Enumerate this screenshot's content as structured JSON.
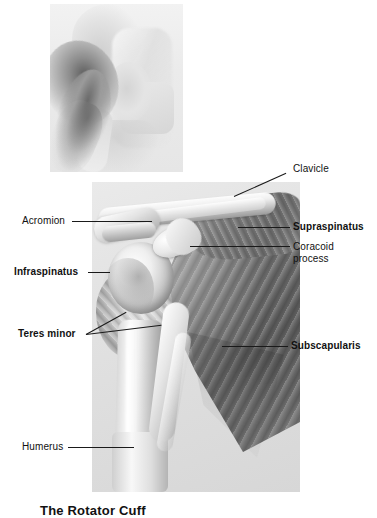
{
  "figure": {
    "caption": "The Rotator Cuff",
    "style": "grayscale medical illustration",
    "panel_background": "#e2e2e2",
    "page_background": "#ffffff",
    "text_color": "#111111",
    "leader_line_color": "#1a1a1a"
  },
  "panels": {
    "inset": {
      "name": "inset-sketch",
      "description": "shoulder sketch"
    },
    "main": {
      "name": "main-illustration",
      "description": "anterior scapula and humerus with rotator cuff muscles"
    }
  },
  "labels": [
    {
      "id": "clavicle",
      "text": "Clavicle",
      "bold": false,
      "lines": [
        "Clavicle"
      ]
    },
    {
      "id": "acromion",
      "text": "Acromion",
      "bold": false,
      "lines": [
        "Acromion"
      ]
    },
    {
      "id": "supraspinatus",
      "text": "Supraspinatus",
      "bold": true,
      "lines": [
        "Supraspinatus"
      ]
    },
    {
      "id": "coracoid",
      "text": "Coracoid process",
      "bold": false,
      "lines": [
        "Coracoid",
        "process"
      ]
    },
    {
      "id": "infraspinatus",
      "text": "Infraspinatus",
      "bold": true,
      "lines": [
        "Infraspinatus"
      ]
    },
    {
      "id": "teres-minor",
      "text": "Teres minor",
      "bold": true,
      "lines": [
        "Teres minor"
      ]
    },
    {
      "id": "subscapularis",
      "text": "Subscapularis",
      "bold": true,
      "lines": [
        "Subscapularis"
      ]
    },
    {
      "id": "humerus",
      "text": "Humerus",
      "bold": false,
      "lines": [
        "Humerus"
      ]
    }
  ],
  "label_text": {
    "clavicle": "Clavicle",
    "acromion": "Acromion",
    "supraspinatus": "Supraspinatus",
    "coracoid_line1": "Coracoid",
    "coracoid_line2": "process",
    "infraspinatus": "Infraspinatus",
    "teres_minor": "Teres minor",
    "subscapularis": "Subscapularis",
    "humerus": "Humerus"
  }
}
